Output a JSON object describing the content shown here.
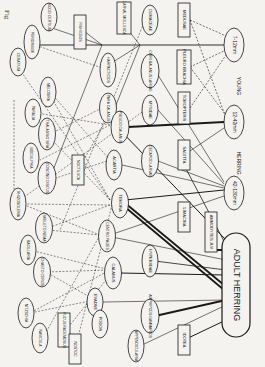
{
  "caption": "Fig",
  "nodes": [
    {
      "id": "adult",
      "label": "ADULT HERRING",
      "shape": "pill",
      "cx": 236,
      "cy": 285,
      "w": 28,
      "h": 104,
      "fs": 9
    },
    {
      "id": "h7",
      "label": "7-12mm",
      "shape": "ellipse",
      "cx": 234,
      "cy": 45,
      "w": 20,
      "h": 34,
      "fs": 5
    },
    {
      "id": "h12",
      "label": "12-42mm",
      "shape": "ellipse",
      "cx": 234,
      "cy": 122,
      "w": 20,
      "h": 34,
      "fs": 5
    },
    {
      "id": "h42",
      "label": "42-130mm",
      "shape": "ellipse",
      "cx": 234,
      "cy": 193,
      "w": 20,
      "h": 34,
      "fs": 5
    },
    {
      "id": "young",
      "label": "YOUNG",
      "shape": "text",
      "cx": 238,
      "cy": 86,
      "fs": 5
    },
    {
      "id": "herringtxt",
      "label": "HERRING",
      "shape": "text",
      "cx": 238,
      "cy": 163,
      "fs": 5
    },
    {
      "id": "medusae",
      "label": "MEDUSAE",
      "shape": "rect",
      "cx": 184,
      "cy": 20,
      "w": 12,
      "h": 34,
      "fs": 4
    },
    {
      "id": "pleuro",
      "label": "PLEURO BRACHIA",
      "shape": "rect",
      "cx": 184,
      "cy": 67,
      "w": 14,
      "h": 34,
      "fs": 4
    },
    {
      "id": "tomopteris",
      "label": "TOMOPTERIS",
      "shape": "rect",
      "cx": 184,
      "cy": 108,
      "w": 12,
      "h": 32,
      "fs": 4
    },
    {
      "id": "sagitta",
      "label": "SAGITTA",
      "shape": "rect",
      "cx": 184,
      "cy": 155,
      "w": 12,
      "h": 30,
      "fs": 4
    },
    {
      "id": "limacina",
      "label": "LIMACINA",
      "shape": "rect",
      "cx": 184,
      "cy": 217,
      "w": 12,
      "h": 30,
      "fs": 4
    },
    {
      "id": "ammodytes",
      "label": "AMMODYTES JUV",
      "shape": "rect",
      "cx": 211,
      "cy": 232,
      "w": 12,
      "h": 40,
      "fs": 4
    },
    {
      "id": "idotea",
      "label": "IDOTEA",
      "shape": "rect",
      "cx": 184,
      "cy": 340,
      "w": 12,
      "h": 30,
      "fs": 4
    },
    {
      "id": "cumaceae",
      "label": "CUMACEAE",
      "shape": "ellipse",
      "cx": 150,
      "cy": 20,
      "w": 16,
      "h": 30,
      "fs": 4
    },
    {
      "id": "cirripedia",
      "label": "CIRRI BALANUS LARVAE",
      "shape": "ellipse",
      "cx": 150,
      "cy": 71,
      "w": 18,
      "h": 34,
      "fs": 3.5
    },
    {
      "id": "mysidae",
      "label": "MYSIDAE",
      "shape": "ellipse",
      "cx": 150,
      "cy": 110,
      "w": 16,
      "h": 30,
      "fs": 4
    },
    {
      "id": "decapod",
      "label": "DECAPOD LARVAE",
      "shape": "ellipse",
      "cx": 150,
      "cy": 161,
      "w": 17,
      "h": 32,
      "fs": 3.5
    },
    {
      "id": "hyperiidae",
      "label": "HYPERIIDAE",
      "shape": "ellipse",
      "cx": 150,
      "cy": 261,
      "w": 16,
      "h": 32,
      "fs": 4
    },
    {
      "id": "amphipods",
      "label": "AMPHIPODS GAMMARIDS",
      "shape": "ellipse",
      "cx": 150,
      "cy": 316,
      "w": 18,
      "h": 34,
      "fs": 3.5
    },
    {
      "id": "appendic",
      "label": "APPENDICULARIA",
      "shape": "ellipse",
      "cx": 136,
      "cy": 346,
      "w": 16,
      "h": 32,
      "fs": 3.5
    },
    {
      "id": "larvalmoll",
      "label": "LARVAL MOLLUSCA",
      "shape": "rect",
      "cx": 124,
      "cy": 18,
      "w": 14,
      "h": 32,
      "fs": 3.5
    },
    {
      "id": "harpacticid",
      "label": "HARPACTICIDS",
      "shape": "ellipse",
      "cx": 108,
      "cy": 70,
      "w": 16,
      "h": 34,
      "fs": 3.5
    },
    {
      "id": "paracal",
      "label": "PARA CALANUS",
      "shape": "ellipse",
      "cx": 108,
      "cy": 108,
      "w": 17,
      "h": 30,
      "fs": 3.5
    },
    {
      "id": "pseudocal",
      "label": "PSEUDO CALANUS",
      "shape": "ellipse",
      "cx": 120,
      "cy": 127,
      "w": 18,
      "h": 32,
      "fs": 3.5
    },
    {
      "id": "acartia",
      "label": "ACARTIA",
      "shape": "ellipse",
      "cx": 114,
      "cy": 165,
      "w": 16,
      "h": 30,
      "fs": 4
    },
    {
      "id": "temora",
      "label": "TEMORA",
      "shape": "ellipse",
      "cx": 120,
      "cy": 203,
      "w": 17,
      "h": 30,
      "fs": 4
    },
    {
      "id": "centropages",
      "label": "CENTRO PAGES",
      "shape": "ellipse",
      "cx": 107,
      "cy": 236,
      "w": 17,
      "h": 32,
      "fs": 3.5
    },
    {
      "id": "calanus",
      "label": "CALANUS",
      "shape": "ellipse",
      "cx": 113,
      "cy": 273,
      "w": 17,
      "h": 32,
      "fs": 4
    },
    {
      "id": "evadne",
      "label": "EVADNE",
      "shape": "ellipse",
      "cx": 95,
      "cy": 302,
      "w": 16,
      "h": 28,
      "fs": 4
    },
    {
      "id": "podon",
      "label": "PODON",
      "shape": "ellipse",
      "cx": 100,
      "cy": 324,
      "w": 16,
      "h": 28,
      "fs": 4
    },
    {
      "id": "fishegg",
      "label": "FISH EGGS",
      "shape": "rect",
      "cx": 80,
      "cy": 32,
      "w": 12,
      "h": 34,
      "fs": 3.5
    },
    {
      "id": "noctiluca",
      "label": "NOCTILUCA",
      "shape": "rect",
      "cx": 78,
      "cy": 170,
      "w": 12,
      "h": 30,
      "fs": 3.5
    },
    {
      "id": "fucus",
      "label": "FUCUS RACEMOSUS",
      "shape": "rect",
      "cx": 64,
      "cy": 330,
      "w": 12,
      "h": 34,
      "fs": 3.5
    },
    {
      "id": "nostoc",
      "label": "NOSTOC",
      "shape": "rect",
      "cx": 75,
      "cy": 349,
      "w": 12,
      "h": 30,
      "fs": 3.5
    },
    {
      "id": "nodopsis",
      "label": "NODO CERTIUM",
      "shape": "ellipse",
      "cx": 49,
      "cy": 17,
      "w": 16,
      "h": 28,
      "fs": 3.5
    },
    {
      "id": "peridinium",
      "label": "PERIDINIUM",
      "shape": "ellipse",
      "cx": 32,
      "cy": 42,
      "w": 16,
      "h": 34,
      "fs": 3.5
    },
    {
      "id": "ceratium",
      "label": "CERATIUM",
      "shape": "ellipse",
      "cx": 18,
      "cy": 62,
      "w": 16,
      "h": 28,
      "fs": 3.5
    },
    {
      "id": "melosira",
      "label": "MELOSIRA",
      "shape": "ellipse",
      "cx": 48,
      "cy": 92,
      "w": 16,
      "h": 30,
      "fs": 3.5
    },
    {
      "id": "paralia",
      "label": "PARALIA",
      "shape": "ellipse",
      "cx": 33,
      "cy": 113,
      "w": 16,
      "h": 28,
      "fs": 3.5
    },
    {
      "id": "thalass",
      "label": "THALASSIO SIRA",
      "shape": "ellipse",
      "cx": 47,
      "cy": 134,
      "w": 17,
      "h": 32,
      "fs": 3.5
    },
    {
      "id": "biddulphia",
      "label": "BIDDULPHIA",
      "shape": "ellipse",
      "cx": 31,
      "cy": 158,
      "w": 16,
      "h": 30,
      "fs": 3.5
    },
    {
      "id": "coscino",
      "label": "COSCINO DISCUS",
      "shape": "ellipse",
      "cx": 47,
      "cy": 178,
      "w": 18,
      "h": 32,
      "fs": 3.5
    },
    {
      "id": "rhizosol",
      "label": "RHIZOSOLENIA",
      "shape": "ellipse",
      "cx": 18,
      "cy": 204,
      "w": 16,
      "h": 32,
      "fs": 3.5
    },
    {
      "id": "skeleton",
      "label": "SKELETO NEMA",
      "shape": "ellipse",
      "cx": 44,
      "cy": 228,
      "w": 17,
      "h": 30,
      "fs": 3.5
    },
    {
      "id": "bacillaria",
      "label": "BACILLARIA",
      "shape": "ellipse",
      "cx": 28,
      "cy": 250,
      "w": 16,
      "h": 30,
      "fs": 3.5
    },
    {
      "id": "chaeto",
      "label": "CHAETO CEROS",
      "shape": "ellipse",
      "cx": 42,
      "cy": 272,
      "w": 17,
      "h": 30,
      "fs": 3.5
    },
    {
      "id": "nitzschia",
      "label": "NITZSCHIA",
      "shape": "ellipse",
      "cx": 26,
      "cy": 313,
      "w": 16,
      "h": 30,
      "fs": 3.5
    },
    {
      "id": "navicula",
      "label": "NAVICULA",
      "shape": "ellipse",
      "cx": 40,
      "cy": 338,
      "w": 16,
      "h": 30,
      "fs": 3.5
    }
  ],
  "edges": [
    {
      "x1": 230,
      "y1": 290,
      "x2": 125,
      "y2": 203,
      "w": 1.8,
      "dash": false
    },
    {
      "x1": 230,
      "y1": 295,
      "x2": 125,
      "y2": 207,
      "w": 1.8,
      "dash": false
    },
    {
      "x1": 226,
      "y1": 300,
      "x2": 155,
      "y2": 316,
      "w": 1.8,
      "dash": false
    },
    {
      "x1": 226,
      "y1": 320,
      "x2": 184,
      "y2": 340,
      "w": 1,
      "dash": false
    },
    {
      "x1": 226,
      "y1": 275,
      "x2": 120,
      "y2": 273,
      "w": 1,
      "dash": false
    },
    {
      "x1": 226,
      "y1": 270,
      "x2": 155,
      "y2": 261,
      "w": 0.8,
      "dash": false
    },
    {
      "x1": 226,
      "y1": 300,
      "x2": 103,
      "y2": 302,
      "w": 0.6,
      "dash": false
    },
    {
      "x1": 226,
      "y1": 305,
      "x2": 140,
      "y2": 346,
      "w": 0.6,
      "dash": false
    },
    {
      "x1": 226,
      "y1": 250,
      "x2": 211,
      "y2": 250,
      "w": 2,
      "dash": false
    },
    {
      "x1": 226,
      "y1": 240,
      "x2": 120,
      "y2": 130,
      "w": 1,
      "dash": false
    },
    {
      "x1": 226,
      "y1": 245,
      "x2": 184,
      "y2": 165,
      "w": 0.8,
      "dash": false
    },
    {
      "x1": 226,
      "y1": 260,
      "x2": 107,
      "y2": 236,
      "w": 0.6,
      "dash": false
    },
    {
      "x1": 224,
      "y1": 122,
      "x2": 128,
      "y2": 127,
      "w": 2,
      "dash": false
    },
    {
      "x1": 224,
      "y1": 128,
      "x2": 184,
      "y2": 155,
      "w": 0.6,
      "dash": false
    },
    {
      "x1": 224,
      "y1": 190,
      "x2": 125,
      "y2": 200,
      "w": 1,
      "dash": false
    },
    {
      "x1": 224,
      "y1": 188,
      "x2": 122,
      "y2": 165,
      "w": 0.6,
      "dash": false
    },
    {
      "x1": 224,
      "y1": 186,
      "x2": 158,
      "y2": 161,
      "w": 0.6,
      "dash": false
    },
    {
      "x1": 224,
      "y1": 184,
      "x2": 158,
      "y2": 110,
      "w": 0.6,
      "dash": false
    },
    {
      "x1": 224,
      "y1": 182,
      "x2": 158,
      "y2": 75,
      "w": 0.6,
      "dash": false
    },
    {
      "x1": 224,
      "y1": 196,
      "x2": 107,
      "y2": 236,
      "w": 0.6,
      "dash": false
    },
    {
      "x1": 224,
      "y1": 45,
      "x2": 40,
      "y2": 45,
      "w": 0.9,
      "dash": false
    },
    {
      "x1": 102,
      "y1": 45,
      "x2": 80,
      "y2": 28,
      "w": 0.6,
      "dash": false
    },
    {
      "x1": 102,
      "y1": 45,
      "x2": 52,
      "y2": 28,
      "w": 0.6,
      "dash": false
    },
    {
      "x1": 140,
      "y1": 45,
      "x2": 128,
      "y2": 30,
      "w": 0.6,
      "dash": false
    },
    {
      "x1": 140,
      "y1": 45,
      "x2": 113,
      "y2": 62,
      "w": 0.6,
      "dash": false
    },
    {
      "x1": 102,
      "y1": 45,
      "x2": 50,
      "y2": 178,
      "w": 0.6,
      "dash": false
    },
    {
      "x1": 140,
      "y1": 45,
      "x2": 110,
      "y2": 120,
      "w": 0.6,
      "dash": false
    },
    {
      "x1": 190,
      "y1": 20,
      "x2": 226,
      "y2": 36,
      "w": 0.6,
      "dash": true
    },
    {
      "x1": 190,
      "y1": 67,
      "x2": 226,
      "y2": 50,
      "w": 0.6,
      "dash": true
    },
    {
      "x1": 190,
      "y1": 67,
      "x2": 226,
      "y2": 115,
      "w": 0.6,
      "dash": true
    },
    {
      "x1": 190,
      "y1": 108,
      "x2": 226,
      "y2": 55,
      "w": 0.6,
      "dash": true
    },
    {
      "x1": 190,
      "y1": 20,
      "x2": 226,
      "y2": 118,
      "w": 0.6,
      "dash": true
    },
    {
      "x1": 110,
      "y1": 200,
      "x2": 20,
      "y2": 70,
      "w": 0.5,
      "dash": true
    },
    {
      "x1": 110,
      "y1": 200,
      "x2": 50,
      "y2": 95,
      "w": 0.5,
      "dash": true
    },
    {
      "x1": 110,
      "y1": 200,
      "x2": 50,
      "y2": 138,
      "w": 0.5,
      "dash": true
    },
    {
      "x1": 110,
      "y1": 205,
      "x2": 24,
      "y2": 204,
      "w": 0.5,
      "dash": true
    },
    {
      "x1": 110,
      "y1": 205,
      "x2": 48,
      "y2": 228,
      "w": 0.5,
      "dash": true
    },
    {
      "x1": 110,
      "y1": 270,
      "x2": 46,
      "y2": 272,
      "w": 0.5,
      "dash": true
    },
    {
      "x1": 110,
      "y1": 270,
      "x2": 30,
      "y2": 250,
      "w": 0.5,
      "dash": true
    },
    {
      "x1": 110,
      "y1": 270,
      "x2": 30,
      "y2": 313,
      "w": 0.5,
      "dash": true
    },
    {
      "x1": 110,
      "y1": 125,
      "x2": 40,
      "y2": 160,
      "w": 0.5,
      "dash": true
    },
    {
      "x1": 110,
      "y1": 125,
      "x2": 37,
      "y2": 113,
      "w": 0.5,
      "dash": true
    },
    {
      "x1": 110,
      "y1": 160,
      "x2": 50,
      "y2": 180,
      "w": 0.5,
      "dash": true
    },
    {
      "x1": 110,
      "y1": 160,
      "x2": 50,
      "y2": 92,
      "w": 0.5,
      "dash": true
    },
    {
      "x1": 100,
      "y1": 235,
      "x2": 48,
      "y2": 230,
      "w": 0.5,
      "dash": true
    },
    {
      "x1": 100,
      "y1": 235,
      "x2": 22,
      "y2": 204,
      "w": 0.5,
      "dash": true
    },
    {
      "x1": 100,
      "y1": 235,
      "x2": 44,
      "y2": 336,
      "w": 0.5,
      "dash": true
    },
    {
      "x1": 95,
      "y1": 300,
      "x2": 30,
      "y2": 313,
      "w": 0.5,
      "dash": true
    },
    {
      "x1": 95,
      "y1": 300,
      "x2": 46,
      "y2": 272,
      "w": 0.5,
      "dash": true
    },
    {
      "x1": 108,
      "y1": 105,
      "x2": 50,
      "y2": 134,
      "w": 0.5,
      "dash": true
    },
    {
      "x1": 108,
      "y1": 70,
      "x2": 35,
      "y2": 45,
      "w": 0.5,
      "dash": true
    },
    {
      "x1": 145,
      "y1": 110,
      "x2": 20,
      "y2": 200,
      "w": 0.5,
      "dash": true
    },
    {
      "x1": 145,
      "y1": 20,
      "x2": 60,
      "y2": 230,
      "w": 0.5,
      "dash": true
    },
    {
      "x1": 78,
      "y1": 170,
      "x2": 112,
      "y2": 110,
      "w": 0.5,
      "dash": true
    },
    {
      "x1": 14,
      "y1": 100,
      "x2": 14,
      "y2": 200,
      "w": 0.5,
      "dash": true
    },
    {
      "x1": 66,
      "y1": 330,
      "x2": 110,
      "y2": 275,
      "w": 0.5,
      "dash": true
    },
    {
      "x1": 75,
      "y1": 349,
      "x2": 112,
      "y2": 205,
      "w": 0.5,
      "dash": true
    }
  ],
  "colors": {
    "background": "#f4f3ef",
    "ink": "#1a1a1a"
  }
}
